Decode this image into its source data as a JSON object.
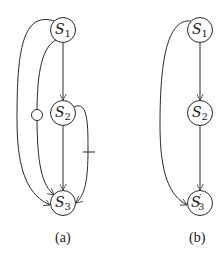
{
  "panels": [
    {
      "id": "a",
      "caption": "(a)",
      "nodes": [
        {
          "id": "S1",
          "base": "S",
          "sub": "1",
          "prime": ""
        },
        {
          "id": "S2",
          "base": "S",
          "sub": "2",
          "prime": ""
        },
        {
          "id": "S3",
          "base": "S",
          "sub": "3",
          "prime": ""
        }
      ],
      "edges": [
        {
          "from": "S1",
          "to": "S2",
          "style": "straight",
          "mark": "none"
        },
        {
          "from": "S2",
          "to": "S3",
          "style": "straight",
          "mark": "none"
        },
        {
          "from": "S1",
          "to": "S3",
          "style": "outer-left-curve",
          "mark": "none"
        },
        {
          "from": "S1",
          "to": "S3",
          "style": "inner-left-curve",
          "mark": "circle"
        },
        {
          "from": "S2",
          "to": "S3",
          "style": "right-curve",
          "mark": "bar"
        }
      ]
    },
    {
      "id": "b",
      "caption": "(b)",
      "nodes": [
        {
          "id": "S1",
          "base": "S",
          "sub": "1",
          "prime": ""
        },
        {
          "id": "S2",
          "base": "S",
          "sub": "2",
          "prime": ""
        },
        {
          "id": "S3'",
          "base": "S",
          "sub": "3",
          "prime": "′"
        }
      ],
      "edges": [
        {
          "from": "S1",
          "to": "S2",
          "style": "straight",
          "mark": "none"
        },
        {
          "from": "S2",
          "to": "S3'",
          "style": "straight",
          "mark": "none"
        },
        {
          "from": "S1",
          "to": "S3'",
          "style": "left-curve",
          "mark": "none"
        }
      ]
    }
  ],
  "colors": {
    "stroke": "#2a2a2a",
    "background": "#ffffff"
  }
}
